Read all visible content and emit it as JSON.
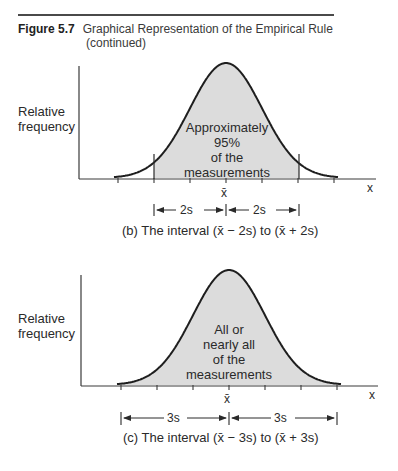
{
  "header": {
    "figure_number": "Figure 5.7",
    "title": "Graphical Representation of the Empirical Rule",
    "continued": "(continued)"
  },
  "chart_data": [
    {
      "type": "area",
      "panel": "b",
      "title": "(b) The interval (x̄ − 2s) to (x̄ + 2s)",
      "ylabel": "Relative frequency",
      "xlabel": "x",
      "x_ticks_in_s_from_mean": [
        -3,
        -2,
        -1,
        0,
        1,
        2,
        3
      ],
      "center_tick_label": "x̄",
      "shaded_range_s": [
        -2,
        2
      ],
      "shaded_label": "Approximately 95% of the measurements",
      "interval_labels": [
        "2s",
        "2s"
      ],
      "grid": false
    },
    {
      "type": "area",
      "panel": "c",
      "title": "(c) The interval (x̄ − 3s) to (x̄ + 3s)",
      "ylabel": "Relative frequency",
      "xlabel": "x",
      "x_ticks_in_s_from_mean": [
        -3,
        -2,
        -1,
        0,
        1,
        2,
        3
      ],
      "center_tick_label": "x̄",
      "shaded_range_s": [
        -3,
        3
      ],
      "shaded_label": "All or nearly all of the measurements",
      "interval_labels": [
        "3s",
        "3s"
      ],
      "grid": false
    }
  ],
  "panel_b": {
    "ylabel_line1": "Relative",
    "ylabel_line2": "frequency",
    "inner_line1": "Approximately",
    "inner_line2": "95%",
    "inner_line3": "of the",
    "inner_line4": "measurements",
    "axis_label": "x",
    "mean_label": "x̄",
    "left_interval": "2s",
    "right_interval": "2s",
    "caption": "(b) The interval (x̄ − 2s) to (x̄ + 2s)"
  },
  "panel_c": {
    "ylabel_line1": "Relative",
    "ylabel_line2": "frequency",
    "inner_line1": "All or",
    "inner_line2": "nearly all",
    "inner_line3": "of the",
    "inner_line4": "measurements",
    "axis_label": "x",
    "mean_label": "x̄",
    "left_interval": "3s",
    "right_interval": "3s",
    "caption": "(c) The interval (x̄ − 3s) to (x̄ + 3s)"
  },
  "colors": {
    "shade": "#dcdcdc",
    "line": "#1e1e1e",
    "axis": "#3a3a3a"
  }
}
